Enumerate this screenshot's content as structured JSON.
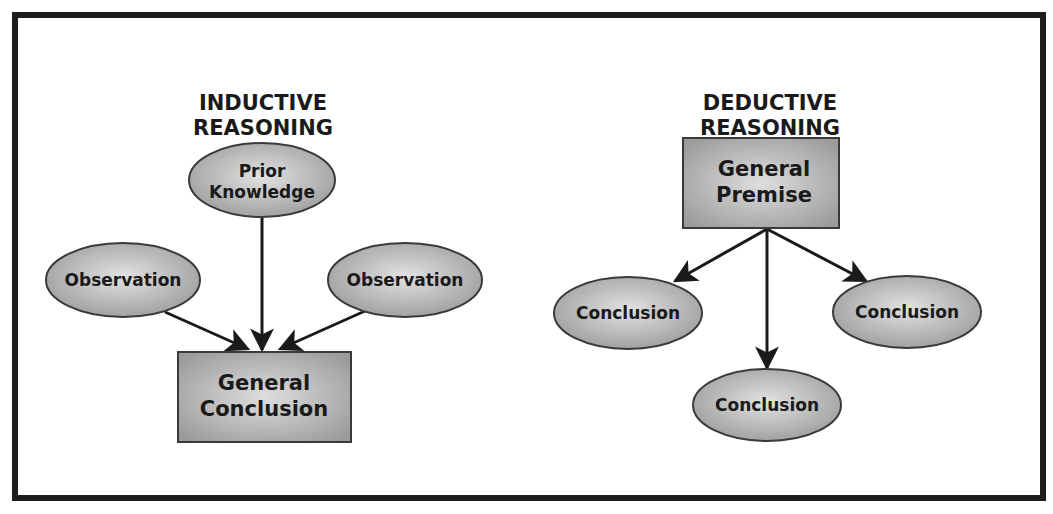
{
  "diagram": {
    "inductive": {
      "title_line1": "INDUCTIVE",
      "title_line2": "REASONING",
      "nodes": {
        "prior_knowledge": {
          "line1": "Prior",
          "line2": "Knowledge",
          "shape": "ellipse"
        },
        "observation_left": {
          "label": "Observation",
          "shape": "ellipse"
        },
        "observation_right": {
          "label": "Observation",
          "shape": "ellipse"
        },
        "general_conclusion": {
          "line1": "General",
          "line2": "Conclusion",
          "shape": "rectangle"
        }
      },
      "edges": [
        {
          "from": "prior_knowledge",
          "to": "general_conclusion"
        },
        {
          "from": "observation_left",
          "to": "general_conclusion"
        },
        {
          "from": "observation_right",
          "to": "general_conclusion"
        }
      ]
    },
    "deductive": {
      "title_line1": "DEDUCTIVE",
      "title_line2": "REASONING",
      "nodes": {
        "general_premise": {
          "line1": "General",
          "line2": "Premise",
          "shape": "rectangle"
        },
        "conclusion_left": {
          "label": "Conclusion",
          "shape": "ellipse"
        },
        "conclusion_bottom": {
          "label": "Conclusion",
          "shape": "ellipse"
        },
        "conclusion_right": {
          "label": "Conclusion",
          "shape": "ellipse"
        }
      },
      "edges": [
        {
          "from": "general_premise",
          "to": "conclusion_left"
        },
        {
          "from": "general_premise",
          "to": "conclusion_bottom"
        },
        {
          "from": "general_premise",
          "to": "conclusion_right"
        }
      ]
    },
    "colors": {
      "frame": "#1e1e1e",
      "node_fill_light": "#dcdcdc",
      "node_fill_dark": "#9a9a9a",
      "node_stroke": "#3a3a3a",
      "text": "#1a1a1a",
      "arrow": "#1a1a1a"
    }
  }
}
